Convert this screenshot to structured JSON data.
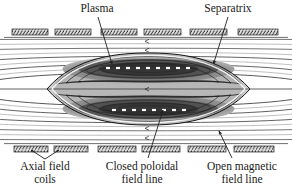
{
  "figure": {
    "width": 292,
    "height": 194,
    "background_color": "#ffffff",
    "line_color": "#333333",
    "plasma_fill_dark": "#4a4a4a",
    "plasma_fill_light": "#c9c9c9",
    "coil_fill": "#d9d9d9",
    "coil_stroke": "#2a2a2a"
  },
  "labels": {
    "plasma": "Plasma",
    "separatrix": "Separatrix",
    "axial_field_coils": "Axial field\ncoils",
    "closed_poloidal_field_line": "Closed poloidal\nfield line",
    "open_magnetic_field_line": "Open magnetic\nfield line"
  },
  "diagram": {
    "coil_rows": [
      {
        "name": "top-coil-row",
        "y": 29,
        "height": 6,
        "segments": [
          {
            "x": 12,
            "width": 36
          },
          {
            "x": 55,
            "width": 36
          },
          {
            "x": 101,
            "width": 36
          },
          {
            "x": 144,
            "width": 37
          },
          {
            "x": 190,
            "width": 37
          },
          {
            "x": 238,
            "width": 40
          }
        ]
      },
      {
        "name": "bottom-coil-row",
        "y": 146,
        "height": 6,
        "segments": [
          {
            "x": 14,
            "width": 34
          },
          {
            "x": 54,
            "width": 34
          },
          {
            "x": 98,
            "width": 38
          },
          {
            "x": 142,
            "width": 38
          },
          {
            "x": 188,
            "width": 38
          },
          {
            "x": 234,
            "width": 40
          }
        ]
      }
    ],
    "separatrix": {
      "left_x_point": [
        47,
        89
      ],
      "right_x_point": [
        250,
        89
      ],
      "top_apex_y": 56,
      "bottom_apex_y": 122
    },
    "closed_flux_surfaces_count": 6,
    "open_field_lines_count": 8,
    "magnetic_axis_markers": {
      "upper_y": 68,
      "lower_y": 110,
      "count": 9,
      "color": "#ffffff"
    },
    "arrows": [
      {
        "name": "plasma-leader",
        "from": [
          98,
          17
        ],
        "to": [
          112,
          64
        ]
      },
      {
        "name": "separatrix-leader",
        "from": [
          228,
          17
        ],
        "to": [
          213,
          64
        ]
      },
      {
        "name": "axial-coils-leader-left",
        "from": [
          44,
          160
        ],
        "to": [
          30,
          150
        ]
      },
      {
        "name": "axial-coils-leader-right",
        "from": [
          44,
          160
        ],
        "to": [
          57,
          150
        ]
      },
      {
        "name": "closed-field-leader",
        "from": [
          148,
          160
        ],
        "to": [
          163,
          111
        ]
      },
      {
        "name": "open-field-leader",
        "from": [
          230,
          160
        ],
        "to": [
          218,
          133
        ]
      }
    ],
    "field_direction_arrow_marks": [
      {
        "x": 146,
        "y": 41
      },
      {
        "x": 146,
        "y": 51
      },
      {
        "x": 146,
        "y": 89
      },
      {
        "x": 146,
        "y": 128
      },
      {
        "x": 146,
        "y": 139
      }
    ]
  }
}
